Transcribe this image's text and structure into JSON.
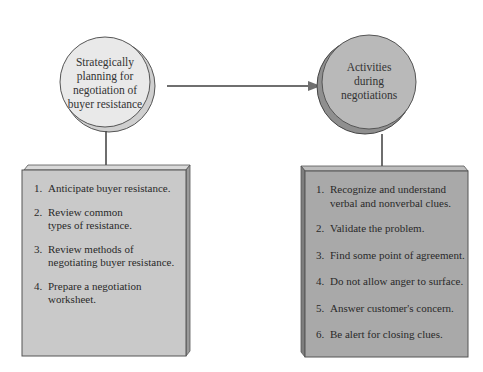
{
  "colors": {
    "left_circle_fill": "#e9e9e9",
    "right_circle_fill": "#b9b9b9",
    "left_box_fill": "#c9c9c9",
    "right_box_fill": "#a9a9a9",
    "stroke": "#555555",
    "arrow": "#6f6f6f"
  },
  "left_node": {
    "title_lines": [
      "Strategically",
      "planning for",
      "negotiation of",
      "buyer resistance"
    ],
    "items": [
      {
        "num": "1.",
        "text": "Anticipate buyer resistance."
      },
      {
        "num": "2.",
        "text": "Review common types of resistance."
      },
      {
        "num": "3.",
        "text": "Review methods of negotiating buyer resistance."
      },
      {
        "num": "4.",
        "text": "Prepare a negotiation worksheet."
      }
    ]
  },
  "right_node": {
    "title_lines": [
      "Activities",
      "during",
      "negotiations"
    ],
    "items": [
      {
        "num": "1.",
        "text": "Recognize and understand verbal and nonverbal clues."
      },
      {
        "num": "2.",
        "text": "Validate the problem."
      },
      {
        "num": "3.",
        "text": "Find some point of agreement."
      },
      {
        "num": "4.",
        "text": "Do not allow anger to surface."
      },
      {
        "num": "5.",
        "text": "Answer customer's concern."
      },
      {
        "num": "6.",
        "text": "Be alert for closing clues."
      }
    ]
  },
  "connector": {
    "from": "left_node",
    "to": "right_node",
    "type": "arrow"
  }
}
